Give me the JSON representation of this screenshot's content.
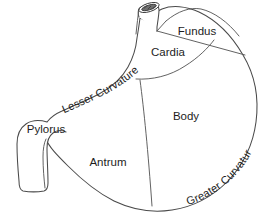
{
  "figure": {
    "style": "line-drawing",
    "background_color": "#ffffff",
    "line_color": "#4a4a4a",
    "text_color": "#1d1d1d"
  },
  "labels": {
    "fundus": "Fundus",
    "cardia": "Cardia",
    "body": "Body",
    "antrum": "Antrum",
    "pylorus": "Pylorus",
    "lesser_curvature": "Lesser Curvature",
    "greater_curvature": "Greater Curvature"
  },
  "regions": [
    {
      "id": "fundus",
      "label": "Fundus",
      "label_x": 197,
      "label_y": 32
    },
    {
      "id": "cardia",
      "label": "Cardia",
      "label_x": 168,
      "label_y": 53
    },
    {
      "id": "body",
      "label": "Body",
      "label_x": 186,
      "label_y": 117
    },
    {
      "id": "antrum",
      "label": "Antrum",
      "label_x": 108,
      "label_y": 163
    },
    {
      "id": "pylorus",
      "label": "Pylorus",
      "label_x": 46,
      "label_y": 130
    }
  ],
  "curvatures": [
    {
      "id": "lesser-curvature",
      "label": "Lesser Curvature",
      "orientation": "arc-upward-right"
    },
    {
      "id": "greater-curvature",
      "label": "Greater Curvature",
      "orientation": "arc-downward-right"
    }
  ],
  "features": {
    "esophagus": "esophagus-tube",
    "lumen": "esophageal-lumen-opening",
    "duodenum": "duodenal-bulb"
  }
}
